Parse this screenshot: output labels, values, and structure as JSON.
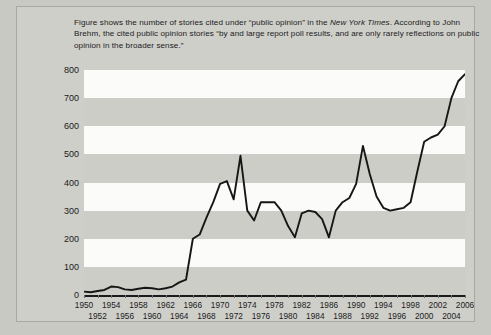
{
  "caption": {
    "line1_a": "Figure shows the number of stories cited under “public opinion” in the ",
    "line1_italic": "New York Times",
    "line1_b": ".",
    "line2": "According to John Brehm, the cited public opinion stories “by and large report poll results,",
    "line3": "and are only rarely reflections on public opinion in the broader sense.”"
  },
  "colors": {
    "figure_background": "#c9c9c4",
    "panel_background": "#cfcfca",
    "band_light": "#fbfbfa",
    "band_dark": "#cdcdc8",
    "line": "#161616",
    "text": "#1b1b1b"
  },
  "chart_data": {
    "type": "line",
    "title": "",
    "xlabel": "",
    "ylabel": "",
    "xlim": [
      1950,
      2006
    ],
    "ylim": [
      0,
      800
    ],
    "ytick_step": 100,
    "yticks": [
      0,
      100,
      200,
      300,
      400,
      500,
      600,
      700,
      800
    ],
    "ytick_labels": [
      "0",
      "100",
      "200",
      "300",
      "400",
      "500",
      "600",
      "700",
      "800"
    ],
    "xticks_row_top": [
      1950,
      1954,
      1958,
      1962,
      1966,
      1970,
      1974,
      1978,
      1982,
      1986,
      1990,
      1994,
      1998,
      2002,
      2006
    ],
    "xticks_row_bottom": [
      1952,
      1956,
      1960,
      1964,
      1968,
      1972,
      1976,
      1980,
      1984,
      1988,
      1992,
      1996,
      2000,
      2004
    ],
    "grid": "horizontal-bands",
    "legend": "none",
    "series_name": "Stories citing “public opinion”",
    "x": [
      1950,
      1951,
      1952,
      1953,
      1954,
      1955,
      1956,
      1957,
      1958,
      1959,
      1960,
      1961,
      1962,
      1963,
      1964,
      1965,
      1966,
      1967,
      1968,
      1969,
      1970,
      1971,
      1972,
      1973,
      1974,
      1975,
      1976,
      1977,
      1978,
      1979,
      1980,
      1981,
      1982,
      1983,
      1984,
      1985,
      1986,
      1987,
      1988,
      1989,
      1990,
      1991,
      1992,
      1993,
      1994,
      1995,
      1996,
      1997,
      1998,
      1999,
      2000,
      2001,
      2002,
      2003,
      2004,
      2005,
      2006
    ],
    "values": [
      12,
      10,
      14,
      18,
      30,
      28,
      20,
      18,
      22,
      26,
      24,
      20,
      24,
      30,
      45,
      55,
      200,
      215,
      275,
      330,
      395,
      405,
      340,
      495,
      300,
      265,
      330,
      330,
      330,
      300,
      245,
      205,
      290,
      300,
      295,
      270,
      205,
      300,
      330,
      345,
      395,
      530,
      430,
      350,
      310,
      300,
      305,
      310,
      330,
      440,
      545,
      560,
      570,
      600,
      700,
      760,
      785
    ]
  }
}
